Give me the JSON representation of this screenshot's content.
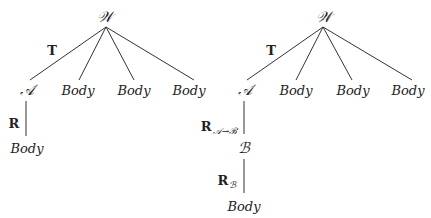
{
  "trees": [
    {
      "id": "left",
      "root": {
        "label": "𝒲",
        "x": 105,
        "y": 17
      },
      "edge_label": {
        "label": "T",
        "x": 52,
        "y": 50
      },
      "children": [
        {
          "label": "𝒜",
          "x": 27,
          "y": 90
        },
        {
          "label": "Body",
          "x": 78,
          "y": 90
        },
        {
          "label": "Body",
          "x": 134,
          "y": 90
        },
        {
          "label": "Body",
          "x": 189,
          "y": 90
        }
      ],
      "chain": [
        {
          "edge_label": "R",
          "edge_sub": "",
          "edge_label_x": 14,
          "edge_label_y": 123,
          "line_x": 26,
          "y1": 100,
          "y2": 136
        },
        {
          "node": "Body",
          "x": 27,
          "y": 148
        }
      ]
    },
    {
      "id": "right",
      "root": {
        "label": "𝒲",
        "x": 324,
        "y": 17
      },
      "edge_label": {
        "label": "T",
        "x": 271,
        "y": 50
      },
      "children": [
        {
          "label": "𝒜",
          "x": 245,
          "y": 90
        },
        {
          "label": "Body",
          "x": 296,
          "y": 90
        },
        {
          "label": "Body",
          "x": 353,
          "y": 90
        },
        {
          "label": "Body",
          "x": 408,
          "y": 90
        }
      ],
      "chain": [
        {
          "edge_label": "R",
          "edge_sub": "𝒜→ℬ",
          "edge_label_x": 219,
          "edge_label_y": 126,
          "line_x": 244,
          "y1": 100,
          "y2": 133
        },
        {
          "node": "ℬ",
          "x": 244,
          "y": 148
        },
        {
          "edge_label": "R",
          "edge_sub": "ℬ",
          "edge_label_x": 227,
          "edge_label_y": 180,
          "line_x": 244,
          "y1": 158,
          "y2": 192
        },
        {
          "node": "Body",
          "x": 244,
          "y": 206
        }
      ]
    }
  ],
  "colors": {
    "line": "#333333",
    "text": "#222222",
    "background": "#ffffff"
  }
}
